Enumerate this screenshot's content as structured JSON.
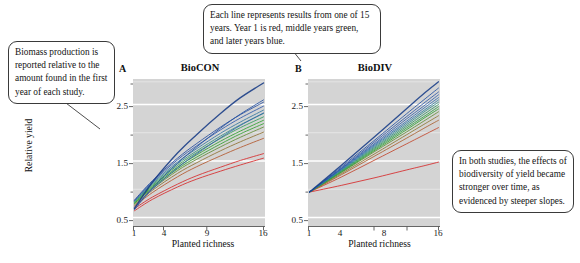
{
  "figure": {
    "panels": [
      {
        "letter": "A",
        "title": "BioCON",
        "xlabel": "Planted richness",
        "ylabel": "Relative yield",
        "xticks": [
          "1",
          "4",
          "9",
          "16"
        ],
        "yticks": [
          "0.5",
          "1.5",
          "2.5"
        ]
      },
      {
        "letter": "B",
        "title": "BioDIV",
        "xlabel": "Planted richness",
        "ylabel": "Relative yield",
        "xticks": [
          "1",
          "4",
          "8",
          "16"
        ],
        "yticks": [
          "0.5",
          "1.5",
          "2.5"
        ]
      }
    ]
  },
  "callouts": {
    "biomass": "Biomass production is reported relative to the amount found in the first year of each study.",
    "lines": "Each line represents results from one of 15 years. Year 1 is red, middle years green, and later years blue.",
    "effects": "In both studies, the effects of biodiversity of yield became stronger over time, as evidenced by steeper slopes."
  },
  "colors": {
    "panel_background": "#d4d4d4",
    "gridline_major": "#ffffff",
    "gridline_minor": "#ececec",
    "early_year": "#d62728",
    "middle_year": "#2ca02c",
    "later_year": "#1f4ea1",
    "callout_border": "#3a3a3a"
  },
  "chart_data": {
    "type": "line",
    "xlabel": "Planted richness",
    "ylabel": "Relative yield",
    "ylim": [
      0.35,
      2.95
    ],
    "grid": true,
    "legend": "none",
    "n_years": 15,
    "panels": [
      {
        "letter": "A",
        "name": "BioCON",
        "xlim": [
          1,
          16
        ],
        "x_scale": "sqrt",
        "xticks": [
          1,
          4,
          9,
          16
        ],
        "yticks": [
          0.5,
          1.5,
          2.5
        ],
        "x": [
          1,
          2,
          4,
          6,
          9,
          12,
          16
        ],
        "series": [
          {
            "name": "Year 1",
            "color": "#d62728",
            "values": [
              0.62,
              0.82,
              1.04,
              1.18,
              1.32,
              1.43,
              1.55
            ]
          },
          {
            "name": "Year 2",
            "color": "#d62728",
            "values": [
              0.66,
              0.86,
              1.09,
              1.24,
              1.39,
              1.51,
              1.63
            ]
          },
          {
            "name": "Year 3",
            "color": "#b2562a",
            "values": [
              0.7,
              0.94,
              1.22,
              1.4,
              1.59,
              1.74,
              1.9
            ]
          },
          {
            "name": "Year 4",
            "color": "#8e7030",
            "values": [
              0.72,
              0.98,
              1.28,
              1.47,
              1.68,
              1.84,
              2.01
            ]
          },
          {
            "name": "Year 5",
            "color": "#5f8a33",
            "values": [
              0.74,
              1.01,
              1.33,
              1.53,
              1.75,
              1.92,
              2.1
            ]
          },
          {
            "name": "Year 6",
            "color": "#2ca02c",
            "values": [
              0.75,
              1.03,
              1.36,
              1.57,
              1.8,
              1.98,
              2.16
            ]
          },
          {
            "name": "Year 7",
            "color": "#2ca02c",
            "values": [
              0.76,
              1.05,
              1.39,
              1.61,
              1.85,
              2.03,
              2.22
            ]
          },
          {
            "name": "Year 8",
            "color": "#2f9a58",
            "values": [
              0.77,
              1.07,
              1.42,
              1.65,
              1.9,
              2.09,
              2.28
            ]
          },
          {
            "name": "Year 9",
            "color": "#31907e",
            "values": [
              0.78,
              1.09,
              1.45,
              1.68,
              1.94,
              2.14,
              2.34
            ]
          },
          {
            "name": "Year 10",
            "color": "#3076a0",
            "values": [
              0.79,
              1.11,
              1.48,
              1.72,
              1.99,
              2.19,
              2.4
            ]
          },
          {
            "name": "Year 11",
            "color": "#2f63ab",
            "values": [
              0.68,
              1.0,
              1.38,
              1.63,
              1.91,
              2.13,
              2.35
            ]
          },
          {
            "name": "Year 12",
            "color": "#2a56a8",
            "values": [
              0.8,
              1.13,
              1.52,
              1.77,
              2.05,
              2.26,
              2.47
            ]
          },
          {
            "name": "Year 13",
            "color": "#234a9e",
            "values": [
              0.81,
              1.15,
              1.55,
              1.81,
              2.1,
              2.32,
              2.54
            ]
          },
          {
            "name": "Year 14",
            "color": "#1f4ea1",
            "values": [
              0.64,
              1.02,
              1.46,
              1.75,
              2.08,
              2.33,
              2.58
            ]
          },
          {
            "name": "Year 15",
            "color": "#163a85",
            "values": [
              0.66,
              1.12,
              1.64,
              1.97,
              2.34,
              2.62,
              2.88
            ]
          }
        ]
      },
      {
        "letter": "B",
        "name": "BioDIV",
        "xlim": [
          1,
          16
        ],
        "x_scale": "log2",
        "xticks": [
          1,
          4,
          8,
          16
        ],
        "yticks": [
          0.5,
          1.5,
          2.5
        ],
        "x": [
          1,
          2,
          4,
          8,
          12,
          16
        ],
        "series": [
          {
            "name": "Year 1",
            "color": "#d62728",
            "values": [
              0.95,
              1.07,
              1.2,
              1.34,
              1.42,
              1.48
            ]
          },
          {
            "name": "Year 2",
            "color": "#c2452a",
            "values": [
              0.95,
              1.22,
              1.51,
              1.8,
              1.97,
              2.09
            ]
          },
          {
            "name": "Year 3",
            "color": "#a95f2d",
            "values": [
              0.95,
              1.26,
              1.58,
              1.9,
              2.09,
              2.22
            ]
          },
          {
            "name": "Year 4",
            "color": "#8a7730",
            "values": [
              0.95,
              1.28,
              1.62,
              1.96,
              2.16,
              2.3
            ]
          },
          {
            "name": "Year 5",
            "color": "#5f8d33",
            "values": [
              0.95,
              1.3,
              1.66,
              2.01,
              2.22,
              2.37
            ]
          },
          {
            "name": "Year 6",
            "color": "#2ca02c",
            "values": [
              0.95,
              1.31,
              1.68,
              2.05,
              2.27,
              2.42
            ]
          },
          {
            "name": "Year 7",
            "color": "#2d9c45",
            "values": [
              0.95,
              1.32,
              1.7,
              2.08,
              2.3,
              2.46
            ]
          },
          {
            "name": "Year 8",
            "color": "#2f9663",
            "values": [
              0.95,
              1.33,
              1.72,
              2.11,
              2.34,
              2.5
            ]
          },
          {
            "name": "Year 9",
            "color": "#2f8b86",
            "values": [
              0.95,
              1.34,
              1.74,
              2.14,
              2.38,
              2.54
            ]
          },
          {
            "name": "Year 10",
            "color": "#2e7ba0",
            "values": [
              0.95,
              1.35,
              1.76,
              2.17,
              2.41,
              2.58
            ]
          },
          {
            "name": "Year 11",
            "color": "#2c6aad",
            "values": [
              0.95,
              1.36,
              1.78,
              2.2,
              2.45,
              2.62
            ]
          },
          {
            "name": "Year 12",
            "color": "#2a5cab",
            "values": [
              0.95,
              1.37,
              1.8,
              2.24,
              2.49,
              2.67
            ]
          },
          {
            "name": "Year 13",
            "color": "#2551a3",
            "values": [
              0.95,
              1.38,
              1.83,
              2.28,
              2.54,
              2.72
            ]
          },
          {
            "name": "Year 14",
            "color": "#1f4ea1",
            "values": [
              0.95,
              1.4,
              1.86,
              2.33,
              2.6,
              2.79
            ]
          },
          {
            "name": "Year 15",
            "color": "#173c88",
            "values": [
              0.95,
              1.43,
              1.92,
              2.42,
              2.71,
              2.9
            ]
          }
        ]
      }
    ]
  }
}
